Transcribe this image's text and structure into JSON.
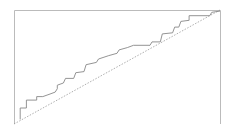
{
  "chart_data": {
    "type": "line",
    "title": "",
    "xlabel": "",
    "ylabel": "",
    "grid": false,
    "legend": null,
    "xlim": [
      0,
      1
    ],
    "ylim": [
      0,
      1
    ],
    "series": [
      {
        "name": "step curve",
        "style": "step",
        "color": "#888888",
        "points": [
          [
            0.03,
            0.04
          ],
          [
            0.03,
            0.14
          ],
          [
            0.06,
            0.14
          ],
          [
            0.06,
            0.21
          ],
          [
            0.11,
            0.21
          ],
          [
            0.11,
            0.24
          ],
          [
            0.14,
            0.24
          ],
          [
            0.17,
            0.26
          ],
          [
            0.2,
            0.28
          ],
          [
            0.21,
            0.31
          ],
          [
            0.21,
            0.34
          ],
          [
            0.24,
            0.36
          ],
          [
            0.25,
            0.4
          ],
          [
            0.29,
            0.4
          ],
          [
            0.3,
            0.45
          ],
          [
            0.34,
            0.46
          ],
          [
            0.35,
            0.52
          ],
          [
            0.4,
            0.54
          ],
          [
            0.41,
            0.57
          ],
          [
            0.46,
            0.6
          ],
          [
            0.5,
            0.62
          ],
          [
            0.51,
            0.65
          ],
          [
            0.55,
            0.67
          ],
          [
            0.58,
            0.69
          ],
          [
            0.66,
            0.69
          ],
          [
            0.67,
            0.72
          ],
          [
            0.71,
            0.72
          ],
          [
            0.72,
            0.79
          ],
          [
            0.77,
            0.8
          ],
          [
            0.78,
            0.85
          ],
          [
            0.8,
            0.85
          ],
          [
            0.81,
            0.9
          ],
          [
            0.85,
            0.91
          ],
          [
            0.85,
            0.95
          ],
          [
            0.95,
            0.95
          ],
          [
            0.96,
            0.98
          ],
          [
            1.0,
            0.99
          ]
        ]
      },
      {
        "name": "diagonal reference",
        "style": "dashed",
        "color": "#999999",
        "points": [
          [
            0,
            0
          ],
          [
            1,
            1
          ]
        ]
      }
    ]
  }
}
